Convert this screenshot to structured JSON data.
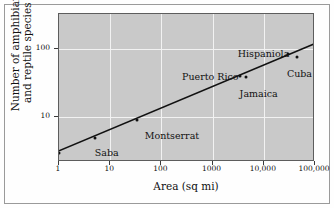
{
  "chart_data": {
    "type": "scatter",
    "title": "",
    "xlabel": "Area  (sq mi)",
    "ylabel_line1": "Number of amphibian",
    "ylabel_line2": "and reptile species",
    "xscale": "log",
    "yscale": "log",
    "xlim": [
      1,
      100000
    ],
    "ylim": [
      2.2,
      320
    ],
    "xticks": [
      1,
      10,
      100,
      1000,
      10000,
      100000
    ],
    "xticklabels": [
      "1",
      "10",
      "100",
      "1000",
      "10,000",
      "100,000"
    ],
    "yticks": [
      10,
      100
    ],
    "yticklabels": [
      "10",
      "100"
    ],
    "grid": true,
    "grid_color": "#f2f2f2",
    "panel_color": "#c9c9c9",
    "legend": "none",
    "points": [
      {
        "label": "Redonda",
        "x": 1,
        "y": 3,
        "label_dx": -2,
        "label_dy": 14
      },
      {
        "label": "Saba",
        "x": 5,
        "y": 5,
        "label_dx": 0,
        "label_dy": 10
      },
      {
        "label": "Montserrat",
        "x": 33,
        "y": 9,
        "label_dx": 8,
        "label_dy": 11
      },
      {
        "label": "Puerto Rico",
        "x": 3435,
        "y": 40,
        "label_dx": -58,
        "label_dy": -4
      },
      {
        "label": "Jamaica",
        "x": 4411,
        "y": 39,
        "label_dx": -6,
        "label_dy": 12
      },
      {
        "label": "Hispaniola",
        "x": 29418,
        "y": 84,
        "label_dx": -50,
        "label_dy": -5
      },
      {
        "label": "Cuba",
        "x": 44218,
        "y": 76,
        "label_dx": -10,
        "label_dy": 12
      }
    ],
    "trendline": {
      "name": "species-area regression",
      "x_start": 1,
      "y_start": 3.2,
      "x_end": 100000,
      "y_end": 118
    }
  },
  "axes": {
    "x_title": "Area  (sq mi)",
    "y_title_line1": "Number of amphibian",
    "y_title_line2": "and reptile species"
  }
}
